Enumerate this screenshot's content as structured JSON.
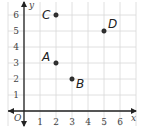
{
  "chart_data": {
    "type": "scatter",
    "title": "",
    "xlabel": "x",
    "ylabel": "y",
    "origin_label": "O",
    "xlim": [
      0,
      6
    ],
    "ylim": [
      0,
      6
    ],
    "grid": true,
    "x_ticks": [
      "1",
      "2",
      "3",
      "4",
      "5",
      "6"
    ],
    "y_ticks": [
      "1",
      "2",
      "3",
      "4",
      "5",
      "6"
    ],
    "points": [
      {
        "label": "A",
        "x": 2,
        "y": 3
      },
      {
        "label": "B",
        "x": 3,
        "y": 2
      },
      {
        "label": "C",
        "x": 2,
        "y": 6
      },
      {
        "label": "D",
        "x": 5,
        "y": 5
      }
    ]
  },
  "colors": {
    "grid": "#d8d8d8",
    "axis": "#222222",
    "point": "#333333"
  }
}
